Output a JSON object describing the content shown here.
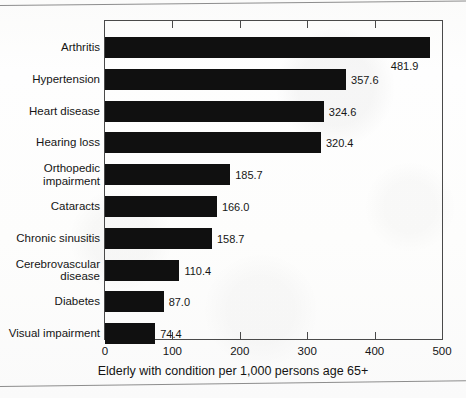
{
  "chart_data": {
    "type": "bar",
    "orientation": "horizontal",
    "title": "",
    "xlabel": "Elderly with condition per 1,000 persons age 65+",
    "ylabel": "",
    "xlim": [
      0,
      500
    ],
    "xticks": [
      "0",
      "100",
      "200",
      "300",
      "400",
      "500"
    ],
    "xtick_values": [
      0,
      100,
      200,
      300,
      400,
      500
    ],
    "grid": false,
    "legend": false,
    "bar_color": "#101010",
    "categories": [
      "Arthritis",
      "Hypertension",
      "Heart disease",
      "Hearing loss",
      "Orthopedic\nimpairment",
      "Cataracts",
      "Chronic sinusitis",
      "Cerebrovascular\ndisease",
      "Diabetes",
      "Visual impairment"
    ],
    "values": [
      481.9,
      357.6,
      324.6,
      320.4,
      185.7,
      166.0,
      158.7,
      110.4,
      87.0,
      74.4
    ],
    "value_labels": [
      "481.9",
      "357.6",
      "324.6",
      "320.4",
      "185.7",
      "166.0",
      "158.7",
      "110.4",
      "87.0",
      "74.4"
    ]
  },
  "caption": {
    "text": "Elderly with condition per 1,000 persons age 65+"
  }
}
